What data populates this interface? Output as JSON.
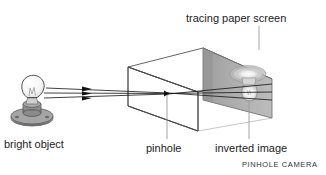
{
  "figure": {
    "title": "PINHOLE CAMERA",
    "caption": "PINHOLE CAMERA",
    "background_color": "#ffffff",
    "ink_color": "#1c1c1c",
    "screen_fill_color": "#a8a8a8",
    "screen_edge_color": "#6f6f6f",
    "bulb_glass_color": "#f2f2f2",
    "bulb_base_color": "#8c8c8c",
    "ray_color": "#111111",
    "leader_line_color": "#9a9a9a",
    "top_clipped_text": "ultraviolet  y  d  p          g          g",
    "labels": {
      "tracing_paper_screen": "tracing paper screen",
      "bright_object": "bright object",
      "pinhole": "pinhole",
      "inverted_image": "inverted image"
    },
    "parts": [
      {
        "id": "bright-object",
        "name": "bright object",
        "kind": "light-bulb-on-socket"
      },
      {
        "id": "light-rays",
        "name": "light rays",
        "kind": "three-arrowed-rays",
        "count": 3
      },
      {
        "id": "camera-box",
        "name": "camera box",
        "kind": "transparent-wireframe-box"
      },
      {
        "id": "pinhole",
        "name": "pinhole",
        "kind": "aperture-point"
      },
      {
        "id": "tracing-paper-screen",
        "name": "tracing paper screen",
        "kind": "shaded-panel"
      },
      {
        "id": "inverted-image",
        "name": "inverted image",
        "kind": "upside-down-bulb"
      }
    ]
  }
}
